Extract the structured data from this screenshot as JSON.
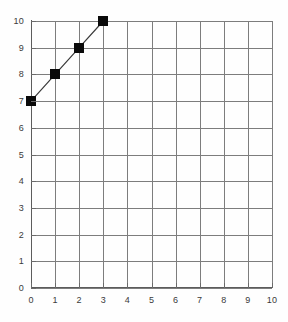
{
  "chart_data": {
    "type": "line",
    "title": "",
    "subtitle": "",
    "xlabel": "",
    "ylabel": "",
    "xlim": [
      0,
      10
    ],
    "ylim": [
      0,
      10
    ],
    "xticks": [
      "0",
      "1",
      "2",
      "3",
      "4",
      "5",
      "6",
      "7",
      "8",
      "9",
      "10"
    ],
    "yticks": [
      "0",
      "1",
      "2",
      "3",
      "4",
      "5",
      "6",
      "7",
      "8",
      "9",
      "10"
    ],
    "grid": true,
    "legend": false,
    "legend_position": "none",
    "marker": "filled-square",
    "series": [
      {
        "name": "",
        "x": [
          0,
          1,
          2,
          3
        ],
        "y": [
          7,
          8,
          9,
          10
        ]
      }
    ],
    "colors": {
      "line": "#3a3a3a",
      "marker": "#0a0a0a",
      "grid": "#7d7d7d",
      "axis": "#5c5c5c",
      "background": "#fefefe",
      "tick_label": "#3a3a3a"
    }
  }
}
